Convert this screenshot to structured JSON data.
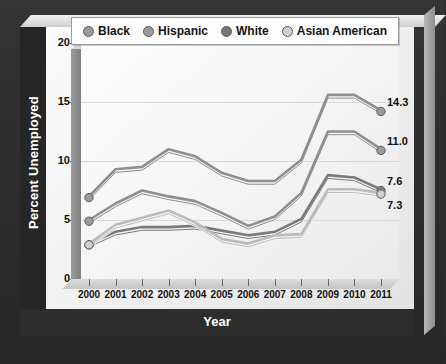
{
  "chart_data": {
    "type": "line",
    "title": "",
    "xlabel": "Year",
    "ylabel": "Percent Unemployed",
    "x": [
      2000,
      2001,
      2002,
      2003,
      2004,
      2005,
      2006,
      2007,
      2008,
      2009,
      2010,
      2011
    ],
    "xticklabels": [
      "2000",
      "2001",
      "2002",
      "2003",
      "2004",
      "2005",
      "2006",
      "2007",
      "2008",
      "2009",
      "2010",
      "2011"
    ],
    "yticklabels": [
      "0",
      "5",
      "10",
      "15",
      "20"
    ],
    "yticks": [
      0,
      5,
      10,
      15,
      20
    ],
    "ylim": [
      0,
      20
    ],
    "grid": true,
    "legend_position": "top",
    "series": [
      {
        "name": "Black",
        "color": "#8f8f8f",
        "marker_color": "#9a9a9a",
        "end_label": "14.3",
        "values": [
          7.0,
          9.3,
          9.5,
          11.0,
          10.4,
          9.0,
          8.3,
          8.3,
          10.1,
          15.6,
          15.6,
          14.3
        ]
      },
      {
        "name": "Hispanic",
        "color": "#8f8f8f",
        "marker_color": "#9a9a9a",
        "end_label": "11.0",
        "values": [
          5.0,
          6.4,
          7.5,
          7.0,
          6.6,
          5.6,
          4.5,
          5.3,
          7.3,
          12.5,
          12.5,
          11.0
        ]
      },
      {
        "name": "White",
        "color": "#7a7a7a",
        "marker_color": "#828282",
        "end_label": "7.6",
        "values": [
          3.0,
          4.0,
          4.4,
          4.4,
          4.5,
          4.1,
          3.7,
          4.0,
          5.1,
          8.8,
          8.6,
          7.6
        ]
      },
      {
        "name": "Asian American",
        "color": "#bcbcbc",
        "marker_color": "#cfcfcf",
        "end_label": "7.3",
        "values": [
          3.0,
          4.6,
          5.2,
          5.8,
          4.8,
          3.4,
          3.0,
          3.7,
          3.8,
          7.6,
          7.6,
          7.3
        ]
      }
    ]
  },
  "legend": {
    "items": [
      {
        "label": "Black",
        "dot_color": "#9a9a9a"
      },
      {
        "label": "Hispanic",
        "dot_color": "#9a9a9a"
      },
      {
        "label": "White",
        "dot_color": "#777777"
      },
      {
        "label": "Asian American",
        "dot_color": "#cfcfcf"
      }
    ]
  },
  "axis_titles": {
    "y": "Percent Unemployed",
    "x": "Year"
  }
}
